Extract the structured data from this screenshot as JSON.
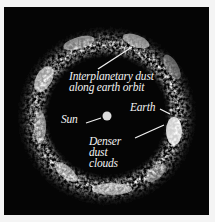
{
  "figure": {
    "background": "#050505",
    "frame_color": "#f4f4f4",
    "ring": {
      "center": [
        103,
        109
      ],
      "outer_radius": 90,
      "inner_radius": 62,
      "color": "#e8e8e8"
    }
  },
  "labels": {
    "dust_line1": "Interplanetary dust",
    "dust_line2": "along earth orbit",
    "sun": "Sun",
    "earth": "Earth",
    "dense_line1": "Denser",
    "dense_line2": "dust",
    "dense_line3": "clouds"
  },
  "objects": {
    "sun": {
      "name": "Sun",
      "x": 103,
      "y": 109,
      "color": "#dcdcdc"
    },
    "earth": {
      "name": "Earth",
      "x": 167,
      "y": 103,
      "color": "#cfcfcf"
    }
  }
}
